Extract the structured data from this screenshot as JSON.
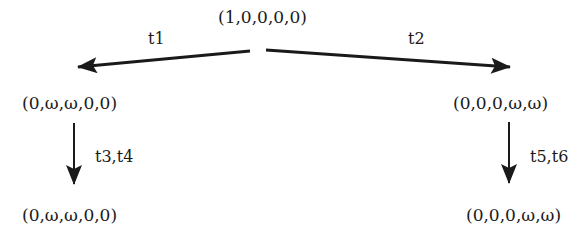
{
  "diagram": {
    "type": "coverability-tree",
    "nodes": [
      {
        "id": "root",
        "label": "(1,0,0,0,0)"
      },
      {
        "id": "left1",
        "label": "(0,ω,ω,0,0)"
      },
      {
        "id": "right1",
        "label": "(0,0,0,ω,ω)"
      },
      {
        "id": "left2",
        "label": "(0,ω,ω,0,0)"
      },
      {
        "id": "right2",
        "label": "(0,0,0,ω,ω)"
      }
    ],
    "edges": [
      {
        "from": "root",
        "to": "left1",
        "label": "t1"
      },
      {
        "from": "root",
        "to": "right1",
        "label": "t2"
      },
      {
        "from": "left1",
        "to": "left2",
        "label": "t3,t4"
      },
      {
        "from": "right1",
        "to": "right2",
        "label": "t5,t6"
      }
    ]
  }
}
